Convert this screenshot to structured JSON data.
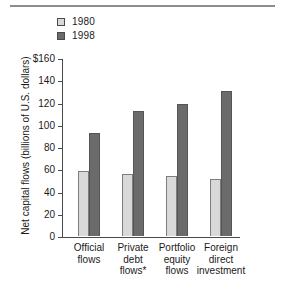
{
  "chart_data": {
    "type": "bar",
    "title": "",
    "xlabel": "",
    "ylabel": "Net capital flows (billions of U.S. dollars)",
    "ylim": [
      0,
      160
    ],
    "ytick_labels": [
      "$160",
      "140",
      "120",
      "100",
      "80",
      "60",
      "40",
      "20",
      "0"
    ],
    "ytick_values": [
      160,
      140,
      120,
      100,
      80,
      60,
      40,
      20,
      0
    ],
    "grid": false,
    "legend_position": "top-left",
    "categories": [
      [
        "Official",
        "flows"
      ],
      [
        "Private",
        "debt",
        "flows*"
      ],
      [
        "Portfolio",
        "equity",
        "flows"
      ],
      [
        "Foreign",
        "direct",
        "investment"
      ]
    ],
    "category_names": [
      "Official flows",
      "Private debt flows*",
      "Portfolio equity flows",
      "Foreign direct investment"
    ],
    "series": [
      {
        "name": "1980",
        "color": "#d9d9d9",
        "values": [
          58,
          56,
          54,
          51
        ]
      },
      {
        "name": "1998",
        "color": "#6b6b6b",
        "values": [
          93,
          112,
          119,
          130
        ]
      }
    ]
  },
  "legend": {
    "items": [
      {
        "label": "1980",
        "swatch": "light-gray-swatch"
      },
      {
        "label": "1998",
        "swatch": "dark-gray-swatch"
      }
    ]
  }
}
